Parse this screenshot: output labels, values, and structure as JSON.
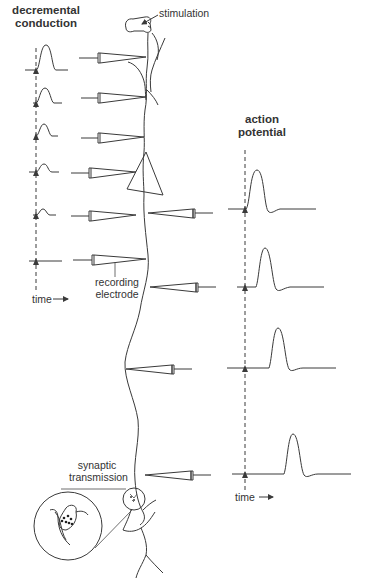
{
  "diagram": {
    "left_panel": {
      "title_line1": "decremental",
      "title_line2": "conduction",
      "time_label": "time",
      "traces": [
        "large",
        "medium",
        "small",
        "smaller",
        "tiny",
        "flat"
      ]
    },
    "right_panel": {
      "title_line1": "action",
      "title_line2": "potential",
      "time_label": "time",
      "traces": [
        "spike-early",
        "spike-mid",
        "spike-later",
        "spike-latest"
      ]
    },
    "labels": {
      "stimulation": "stimulation",
      "recording_line1": "recording",
      "recording_line2": "electrode",
      "synaptic_line1": "synaptic",
      "synaptic_line2": "transmission"
    },
    "icons": {
      "time_arrow": "right-arrow",
      "stimulus_marker": "up-arrow"
    },
    "colors": {
      "line": "#3a3a3a",
      "text": "#333333",
      "background": "#ffffff"
    }
  }
}
